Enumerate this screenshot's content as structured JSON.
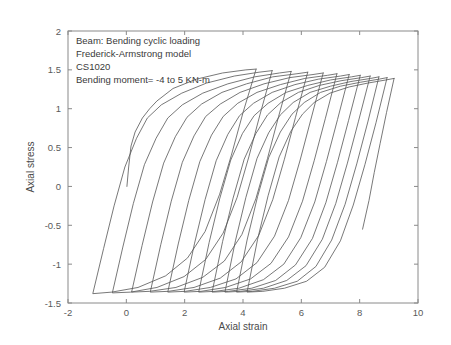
{
  "figure": {
    "background_color": "#ffffff",
    "frame_color": "#8a8a8a",
    "curve_color": "#555555"
  },
  "annotations": {
    "line1": "Beam: Bending cyclic loading",
    "line2": "Frederick-Armstrong model",
    "line3": "CS1020",
    "line4": "Bending moment= -4  to  5 KN-m"
  },
  "chart_data": {
    "type": "line",
    "title": "",
    "subtitle": "",
    "xlabel": "Axial strain",
    "ylabel": "Axial stress",
    "xlim": [
      -2,
      10
    ],
    "ylim": [
      -1.5,
      2
    ],
    "xticks": [
      -2,
      0,
      2,
      4,
      6,
      8,
      10
    ],
    "xticklabels": [
      "-2",
      "0",
      "2",
      "4",
      "6",
      "8",
      "10"
    ],
    "yticks": [
      -1.5,
      -1,
      -0.5,
      0,
      0.5,
      1,
      1.5,
      2
    ],
    "yticklabels": [
      "-1.5",
      "-1",
      "-0.5",
      "0",
      "0.5",
      "1",
      "1.5",
      "2"
    ],
    "grid": false,
    "legend": null,
    "annotations": [
      "Beam: Bending cyclic loading",
      "Frederick-Armstrong model",
      "CS1020",
      "Bending moment= -4  to  5 KN-m"
    ],
    "stress_peak_max": 1.5,
    "stress_peak_min": -1.38,
    "cycles": 10,
    "series": [
      {
        "name": "initial-loading",
        "comment": "Monotonic elastic then plastic rise from origin",
        "points": [
          [
            0.02,
            0.0
          ],
          [
            0.08,
            0.25
          ],
          [
            0.16,
            0.52
          ],
          [
            0.3,
            0.7
          ],
          [
            0.55,
            0.88
          ],
          [
            0.8,
            1.0
          ],
          [
            1.05,
            1.1
          ],
          [
            1.6,
            1.26
          ],
          [
            2.4,
            1.38
          ],
          [
            3.3,
            1.46
          ],
          [
            4.1,
            1.5
          ],
          [
            4.45,
            1.51
          ]
        ]
      },
      {
        "name": "cycle-1",
        "points": [
          [
            4.45,
            1.51
          ],
          [
            4.0,
            0.95
          ],
          [
            3.6,
            0.4
          ],
          [
            3.2,
            -0.1
          ],
          [
            2.7,
            -0.58
          ],
          [
            2.1,
            -0.92
          ],
          [
            1.35,
            -1.15
          ],
          [
            0.4,
            -1.3
          ],
          [
            -0.5,
            -1.36
          ],
          [
            -1.15,
            -1.38
          ],
          [
            -0.78,
            -0.8
          ],
          [
            -0.42,
            -0.25
          ],
          [
            -0.05,
            0.25
          ],
          [
            0.35,
            0.62
          ],
          [
            0.72,
            0.88
          ],
          [
            1.2,
            1.05
          ],
          [
            1.9,
            1.2
          ],
          [
            2.75,
            1.33
          ],
          [
            3.7,
            1.42
          ],
          [
            4.55,
            1.47
          ],
          [
            5.0,
            1.49
          ]
        ]
      },
      {
        "name": "cycle-2",
        "points": [
          [
            5.0,
            1.49
          ],
          [
            4.58,
            0.92
          ],
          [
            4.2,
            0.38
          ],
          [
            3.8,
            -0.14
          ],
          [
            3.32,
            -0.6
          ],
          [
            2.72,
            -0.94
          ],
          [
            1.98,
            -1.16
          ],
          [
            1.05,
            -1.3
          ],
          [
            0.15,
            -1.36
          ],
          [
            -0.48,
            -1.37
          ],
          [
            -0.12,
            -0.78
          ],
          [
            0.24,
            -0.22
          ],
          [
            0.62,
            0.28
          ],
          [
            1.02,
            0.62
          ],
          [
            1.42,
            0.88
          ],
          [
            1.92,
            1.05
          ],
          [
            2.62,
            1.2
          ],
          [
            3.48,
            1.32
          ],
          [
            4.4,
            1.41
          ],
          [
            5.25,
            1.46
          ],
          [
            5.65,
            1.48
          ]
        ]
      },
      {
        "name": "cycle-3",
        "points": [
          [
            5.65,
            1.48
          ],
          [
            5.22,
            0.9
          ],
          [
            4.84,
            0.36
          ],
          [
            4.44,
            -0.16
          ],
          [
            3.96,
            -0.62
          ],
          [
            3.36,
            -0.96
          ],
          [
            2.62,
            -1.17
          ],
          [
            1.7,
            -1.3
          ],
          [
            0.8,
            -1.35
          ],
          [
            0.18,
            -1.36
          ],
          [
            0.54,
            -0.76
          ],
          [
            0.9,
            -0.2
          ],
          [
            1.28,
            0.3
          ],
          [
            1.68,
            0.64
          ],
          [
            2.08,
            0.89
          ],
          [
            2.58,
            1.06
          ],
          [
            3.28,
            1.21
          ],
          [
            4.12,
            1.32
          ],
          [
            5.02,
            1.41
          ],
          [
            5.85,
            1.45
          ],
          [
            6.22,
            1.47
          ]
        ]
      },
      {
        "name": "cycle-4",
        "points": [
          [
            6.22,
            1.47
          ],
          [
            5.8,
            0.89
          ],
          [
            5.42,
            0.35
          ],
          [
            5.02,
            -0.17
          ],
          [
            4.54,
            -0.63
          ],
          [
            3.94,
            -0.97
          ],
          [
            3.22,
            -1.18
          ],
          [
            2.32,
            -1.3
          ],
          [
            1.44,
            -1.35
          ],
          [
            0.82,
            -1.36
          ],
          [
            1.18,
            -0.75
          ],
          [
            1.54,
            -0.19
          ],
          [
            1.92,
            0.31
          ],
          [
            2.32,
            0.65
          ],
          [
            2.72,
            0.9
          ],
          [
            3.22,
            1.06
          ],
          [
            3.9,
            1.21
          ],
          [
            4.72,
            1.32
          ],
          [
            5.6,
            1.4
          ],
          [
            6.4,
            1.44
          ],
          [
            6.75,
            1.46
          ]
        ]
      },
      {
        "name": "cycle-5",
        "points": [
          [
            6.75,
            1.46
          ],
          [
            6.34,
            0.88
          ],
          [
            5.96,
            0.34
          ],
          [
            5.56,
            -0.18
          ],
          [
            5.08,
            -0.64
          ],
          [
            4.48,
            -0.98
          ],
          [
            3.76,
            -1.19
          ],
          [
            2.88,
            -1.3
          ],
          [
            2.02,
            -1.35
          ],
          [
            1.42,
            -1.36
          ],
          [
            1.78,
            -0.74
          ],
          [
            2.14,
            -0.18
          ],
          [
            2.52,
            0.32
          ],
          [
            2.92,
            0.66
          ],
          [
            3.32,
            0.9
          ],
          [
            3.82,
            1.07
          ],
          [
            4.48,
            1.21
          ],
          [
            5.28,
            1.31
          ],
          [
            6.12,
            1.39
          ],
          [
            6.9,
            1.43
          ],
          [
            7.22,
            1.45
          ]
        ]
      },
      {
        "name": "cycle-6",
        "points": [
          [
            7.22,
            1.45
          ],
          [
            6.82,
            0.87
          ],
          [
            6.44,
            0.33
          ],
          [
            6.04,
            -0.19
          ],
          [
            5.56,
            -0.65
          ],
          [
            4.96,
            -0.99
          ],
          [
            4.26,
            -1.19
          ],
          [
            3.4,
            -1.3
          ],
          [
            2.56,
            -1.35
          ],
          [
            1.98,
            -1.36
          ],
          [
            2.34,
            -0.73
          ],
          [
            2.7,
            -0.17
          ],
          [
            3.08,
            0.33
          ],
          [
            3.48,
            0.67
          ],
          [
            3.88,
            0.91
          ],
          [
            4.36,
            1.07
          ],
          [
            5.0,
            1.21
          ],
          [
            5.78,
            1.31
          ],
          [
            6.58,
            1.38
          ],
          [
            7.34,
            1.42
          ],
          [
            7.64,
            1.44
          ]
        ]
      },
      {
        "name": "cycle-7",
        "points": [
          [
            7.64,
            1.44
          ],
          [
            7.24,
            0.86
          ],
          [
            6.86,
            0.32
          ],
          [
            6.46,
            -0.2
          ],
          [
            5.98,
            -0.66
          ],
          [
            5.4,
            -1.0
          ],
          [
            4.7,
            -1.2
          ],
          [
            3.86,
            -1.31
          ],
          [
            3.04,
            -1.35
          ],
          [
            2.48,
            -1.36
          ],
          [
            2.84,
            -0.72
          ],
          [
            3.2,
            -0.16
          ],
          [
            3.58,
            0.34
          ],
          [
            3.98,
            0.68
          ],
          [
            4.38,
            0.91
          ],
          [
            4.86,
            1.07
          ],
          [
            5.48,
            1.21
          ],
          [
            6.22,
            1.3
          ],
          [
            7.0,
            1.37
          ],
          [
            7.72,
            1.41
          ],
          [
            8.02,
            1.43
          ]
        ]
      },
      {
        "name": "cycle-8",
        "points": [
          [
            8.02,
            1.43
          ],
          [
            7.62,
            0.85
          ],
          [
            7.24,
            0.31
          ],
          [
            6.84,
            -0.21
          ],
          [
            6.38,
            -0.67
          ],
          [
            5.8,
            -1.01
          ],
          [
            5.12,
            -1.21
          ],
          [
            4.3,
            -1.31
          ],
          [
            3.5,
            -1.35
          ],
          [
            2.94,
            -1.36
          ],
          [
            3.3,
            -0.71
          ],
          [
            3.66,
            -0.15
          ],
          [
            4.04,
            0.35
          ],
          [
            4.44,
            0.68
          ],
          [
            4.84,
            0.92
          ],
          [
            5.3,
            1.08
          ],
          [
            5.9,
            1.21
          ],
          [
            6.62,
            1.3
          ],
          [
            7.36,
            1.36
          ],
          [
            8.06,
            1.4
          ],
          [
            8.36,
            1.42
          ]
        ]
      },
      {
        "name": "cycle-9",
        "points": [
          [
            8.36,
            1.42
          ],
          [
            7.96,
            0.84
          ],
          [
            7.58,
            0.3
          ],
          [
            7.18,
            -0.22
          ],
          [
            6.72,
            -0.68
          ],
          [
            6.16,
            -1.02
          ],
          [
            5.5,
            -1.21
          ],
          [
            4.7,
            -1.31
          ],
          [
            3.92,
            -1.35
          ],
          [
            3.38,
            -1.36
          ],
          [
            3.74,
            -0.7
          ],
          [
            4.1,
            -0.14
          ],
          [
            4.48,
            0.36
          ],
          [
            4.88,
            0.69
          ],
          [
            5.28,
            0.92
          ],
          [
            5.72,
            1.08
          ],
          [
            6.3,
            1.21
          ],
          [
            7.0,
            1.29
          ],
          [
            7.7,
            1.35
          ],
          [
            8.38,
            1.39
          ],
          [
            8.66,
            1.41
          ]
        ]
      },
      {
        "name": "cycle-10",
        "points": [
          [
            8.66,
            1.41
          ],
          [
            8.28,
            0.83
          ],
          [
            7.9,
            0.29
          ],
          [
            7.5,
            -0.23
          ],
          [
            7.04,
            -0.69
          ],
          [
            6.5,
            -1.03
          ],
          [
            5.86,
            -1.22
          ],
          [
            5.08,
            -1.31
          ],
          [
            4.32,
            -1.35
          ],
          [
            3.78,
            -1.36
          ],
          [
            4.14,
            -0.69
          ],
          [
            4.5,
            -0.13
          ],
          [
            4.88,
            0.37
          ],
          [
            5.28,
            0.7
          ],
          [
            5.68,
            0.93
          ],
          [
            6.1,
            1.08
          ],
          [
            6.66,
            1.21
          ],
          [
            7.34,
            1.29
          ],
          [
            8.02,
            1.34
          ],
          [
            8.66,
            1.38
          ],
          [
            8.94,
            1.4
          ]
        ]
      },
      {
        "name": "cycle-11",
        "points": [
          [
            8.94,
            1.4
          ],
          [
            8.56,
            0.82
          ],
          [
            8.18,
            0.28
          ],
          [
            7.78,
            -0.24
          ],
          [
            7.34,
            -0.7
          ],
          [
            6.8,
            -1.04
          ],
          [
            6.18,
            -1.22
          ],
          [
            5.42,
            -1.31
          ],
          [
            4.68,
            -1.35
          ],
          [
            4.14,
            -1.36
          ],
          [
            4.5,
            -0.68
          ],
          [
            4.86,
            -0.12
          ],
          [
            5.24,
            0.38
          ],
          [
            5.64,
            0.71
          ],
          [
            6.04,
            0.93
          ],
          [
            6.44,
            1.08
          ],
          [
            6.98,
            1.2
          ],
          [
            7.64,
            1.28
          ],
          [
            8.28,
            1.33
          ],
          [
            8.9,
            1.37
          ],
          [
            9.18,
            1.39
          ]
        ]
      },
      {
        "name": "final-unload",
        "points": [
          [
            9.18,
            1.39
          ],
          [
            8.92,
            0.95
          ],
          [
            8.7,
            0.55
          ],
          [
            8.5,
            0.18
          ],
          [
            8.32,
            -0.18
          ],
          [
            8.1,
            -0.55
          ]
        ]
      }
    ]
  }
}
